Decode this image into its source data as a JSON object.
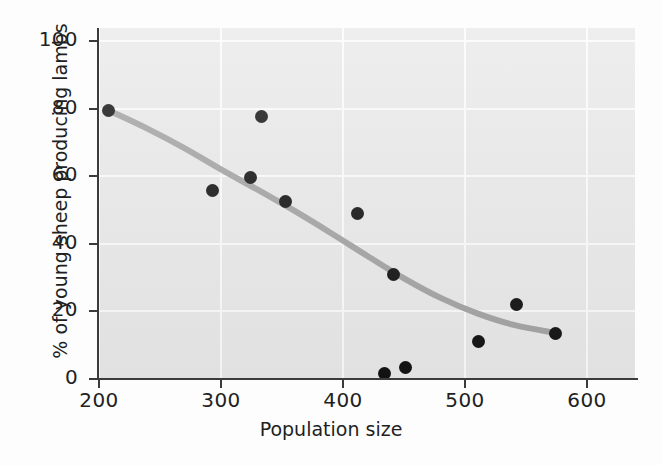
{
  "chart_data": {
    "type": "scatter",
    "title": "",
    "xlabel": "Population size",
    "ylabel": "% of young sheep producing lambs",
    "xlim": [
      180,
      620
    ],
    "ylim": [
      0,
      105
    ],
    "xticks": [
      200,
      300,
      400,
      500,
      600
    ],
    "yticks": [
      0,
      20,
      40,
      60,
      80,
      100
    ],
    "grid": true,
    "legend": null,
    "point_color": "#121212",
    "curve_color": "#a3a3a3",
    "plot_background": "#e9e9e9",
    "gridline_color": "#fbfbfb",
    "points": [
      {
        "x": 208,
        "y": 79.5
      },
      {
        "x": 293,
        "y": 55.9
      },
      {
        "x": 324,
        "y": 59.5
      },
      {
        "x": 333,
        "y": 77.8
      },
      {
        "x": 353,
        "y": 52.4
      },
      {
        "x": 412,
        "y": 49.1
      },
      {
        "x": 434,
        "y": 1.6
      },
      {
        "x": 441,
        "y": 30.9
      },
      {
        "x": 451,
        "y": 3.5
      },
      {
        "x": 511,
        "y": 11.2
      },
      {
        "x": 542,
        "y": 22.0
      },
      {
        "x": 574,
        "y": 13.4
      }
    ],
    "fitted_curve": [
      {
        "x": 209,
        "y": 79.3
      },
      {
        "x": 240,
        "y": 74.0
      },
      {
        "x": 270,
        "y": 68.3
      },
      {
        "x": 300,
        "y": 62.0
      },
      {
        "x": 330,
        "y": 56.0
      },
      {
        "x": 360,
        "y": 49.8
      },
      {
        "x": 390,
        "y": 43.2
      },
      {
        "x": 420,
        "y": 36.4
      },
      {
        "x": 450,
        "y": 29.8
      },
      {
        "x": 480,
        "y": 24.0
      },
      {
        "x": 510,
        "y": 19.4
      },
      {
        "x": 540,
        "y": 16.0
      },
      {
        "x": 574,
        "y": 13.6
      }
    ]
  },
  "axis": {
    "x_tick_labels": [
      "200",
      "300",
      "400",
      "500",
      "600"
    ],
    "y_tick_labels": [
      "0",
      "20",
      "40",
      "60",
      "80",
      "100"
    ],
    "x_title": "Population size",
    "y_title": "% of young sheep producing lambs"
  }
}
